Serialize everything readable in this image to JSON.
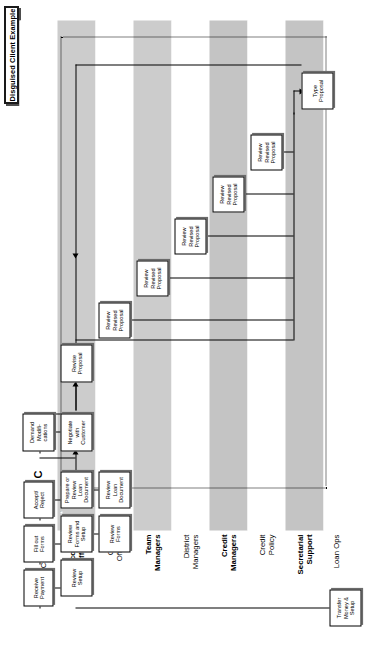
{
  "title": {
    "label": "Disguised Client Example"
  },
  "colors": {
    "band_shaded": "#cccccc",
    "band_plain": "#ffffff",
    "box_border": "#000000",
    "box_fill": "#ffffff",
    "connector": "#000000"
  },
  "diagram": {
    "type": "swimlane-process-flow",
    "loop_marker": "C",
    "lanes": [
      {
        "id": "customer",
        "label": "Role of:\nCustomer",
        "bold": false,
        "shaded": false
      },
      {
        "id": "acct",
        "label": "Account\nOfficers",
        "bold": true,
        "shaded": true
      },
      {
        "id": "credit-off",
        "label": "Credit\nOfficers",
        "bold": false,
        "shaded": false
      },
      {
        "id": "team-mgr",
        "label": "Team\nManagers",
        "bold": true,
        "shaded": true
      },
      {
        "id": "dist-mgr",
        "label": "District\nManagers",
        "bold": false,
        "shaded": false
      },
      {
        "id": "credit-mgr",
        "label": "Credit\nManagers",
        "bold": true,
        "shaded": true
      },
      {
        "id": "credit-pol",
        "label": "Credit\nPolicy",
        "bold": false,
        "shaded": false
      },
      {
        "id": "sec-sup",
        "label": "Secretarial\nSupport",
        "bold": true,
        "shaded": true
      },
      {
        "id": "loan-ops",
        "label": "Loan Ops",
        "bold": false,
        "shaded": false
      }
    ],
    "nodes": [
      {
        "id": "write-proposal",
        "label": "Write\nProposal",
        "lane": "acct"
      },
      {
        "id": "negotiate-customer",
        "label": "Negotiate\nwith\nCustomer",
        "lane": "acct"
      },
      {
        "id": "demand-modifications",
        "label": "Demand\nModifi-\ncations",
        "lane": "customer"
      },
      {
        "id": "revise-proposal",
        "label": "Revise\nProposal",
        "lane": "acct"
      },
      {
        "id": "review-revised-1",
        "label": "Review\nRevised\nProposal",
        "lane": "credit-off"
      },
      {
        "id": "review-revised-2",
        "label": "Review\nRevised\nProposal",
        "lane": "team-mgr"
      },
      {
        "id": "review-revised-3",
        "label": "Review\nRevised\nProposal",
        "lane": "dist-mgr"
      },
      {
        "id": "review-revised-4",
        "label": "Review\nRevised\nProposal",
        "lane": "credit-mgr"
      },
      {
        "id": "review-revised-5",
        "label": "Review\nRevised\nProposal",
        "lane": "credit-pol"
      },
      {
        "id": "type-proposal",
        "label": "Type\nProposal",
        "lane": "sec-sup"
      },
      {
        "id": "accept-reject",
        "label": "Accept/\nReject",
        "lane": "customer"
      },
      {
        "id": "prepare-review-loan",
        "label": "Prepare or\nReview\nLoan\nDocument",
        "lane": "acct"
      },
      {
        "id": "review-loan-doc",
        "label": "Review\nLoan\nDocument",
        "lane": "credit-off"
      },
      {
        "id": "fill-out-forms",
        "label": "Fill out\nForms",
        "lane": "customer"
      },
      {
        "id": "review-forms-setup",
        "label": "Review\nForms and\nSetup",
        "lane": "acct"
      },
      {
        "id": "review-forms",
        "label": "Review\nForms",
        "lane": "credit-off"
      },
      {
        "id": "receive-payment",
        "label": "Receive\nPayment",
        "lane": "customer"
      },
      {
        "id": "review-setup",
        "label": "Review\nSetup",
        "lane": "acct"
      },
      {
        "id": "transfer-money-setup",
        "label": "Transfer\nMoney &\nSetup",
        "lane": "loan-ops"
      }
    ]
  }
}
